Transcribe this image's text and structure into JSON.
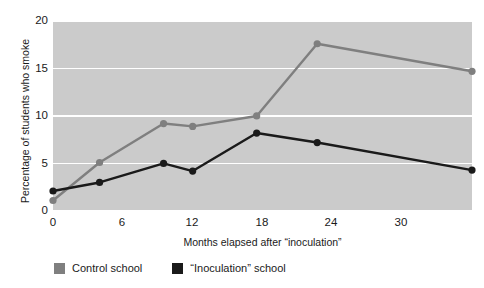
{
  "chart_data": {
    "type": "line",
    "title": "",
    "xlabel": "Months elapsed after “inoculation”",
    "ylabel": "Percentage of students who smoke",
    "xlim": [
      0,
      36
    ],
    "ylim": [
      0,
      20
    ],
    "xticks": [
      0,
      6,
      12,
      18,
      24,
      30
    ],
    "yticks": [
      0,
      5,
      10,
      15,
      20
    ],
    "xtick_labels": [
      "0",
      "6",
      "12",
      "18",
      "24",
      "30"
    ],
    "ytick_labels": [
      "0",
      "5",
      "10",
      "15",
      "20"
    ],
    "grid": "horizontal-white-gridlines",
    "plot_background": "#cbcbcb",
    "legend_position": "below-axes-left",
    "series": [
      {
        "name": "Control school",
        "color": "#7f7f7f",
        "marker": "circle",
        "x": [
          0,
          4,
          9.5,
          12,
          17.5,
          22.7,
          36
        ],
        "values": [
          1.0,
          5.0,
          9.1,
          8.8,
          9.9,
          17.5,
          14.6
        ]
      },
      {
        "name": "“Inoculation” school",
        "color": "#1a1a1a",
        "marker": "circle",
        "x": [
          0,
          4,
          9.5,
          12,
          17.5,
          22.7,
          36
        ],
        "values": [
          2.0,
          2.9,
          4.9,
          4.1,
          8.1,
          7.1,
          4.2
        ]
      }
    ]
  },
  "axes": {
    "y_title": "Percentage of students who smoke",
    "x_title": "Months elapsed after “inoculation”",
    "y_ticks": [
      "20",
      "15",
      "10",
      "5",
      "0"
    ],
    "x_ticks": [
      "0",
      "6",
      "12",
      "18",
      "24",
      "30"
    ]
  },
  "legend": {
    "items": [
      {
        "label": "Control school",
        "color": "#7f7f7f"
      },
      {
        "label": "“Inoculation” school",
        "color": "#1a1a1a"
      }
    ]
  },
  "cropped_title": ""
}
